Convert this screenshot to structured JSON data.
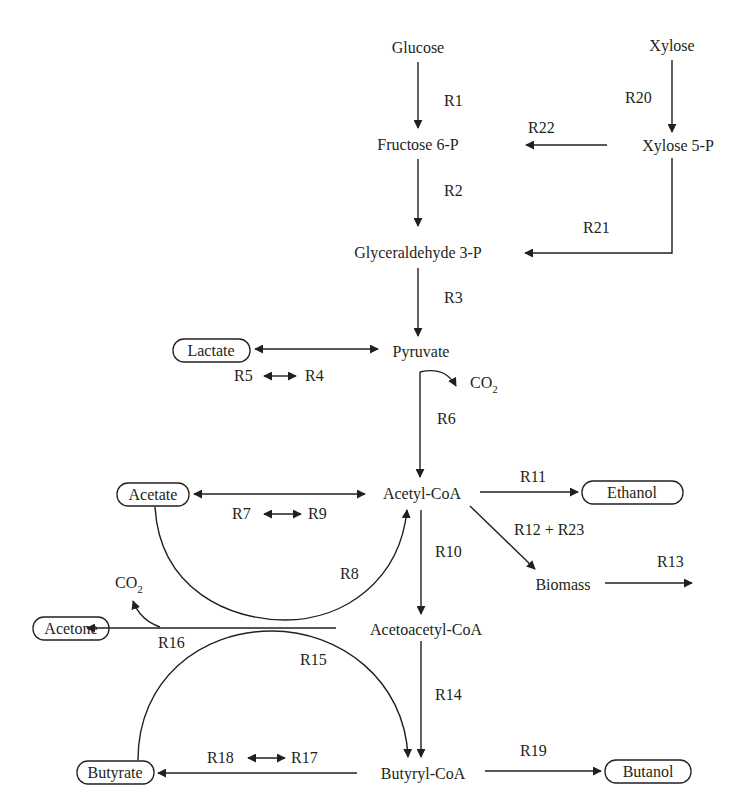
{
  "diagram": {
    "type": "metabolic-pathway",
    "metabolites": {
      "glucose": "Glucose",
      "xylose": "Xylose",
      "fructose6p": "Fructose 6-P",
      "xylose5p": "Xylose 5-P",
      "glyceraldehyde3p": "Glyceraldehyde 3-P",
      "pyruvate": "Pyruvate",
      "lactate": "Lactate",
      "co2_pyruvate": "CO",
      "co2_pyruvate_sub": "2",
      "acetylcoa": "Acetyl-CoA",
      "acetate": "Acetate",
      "ethanol": "Ethanol",
      "biomass": "Biomass",
      "acetoacetylcoa": "Acetoacetyl-CoA",
      "acetone": "Acetone",
      "co2_acetone": "CO",
      "co2_acetone_sub": "2",
      "butyrylcoa": "Butyryl-CoA",
      "butyrate": "Butyrate",
      "butanol": "Butanol"
    },
    "reactions": {
      "r1": "R1",
      "r2": "R2",
      "r3": "R3",
      "r4": "R4",
      "r5": "R5",
      "r6": "R6",
      "r7": "R7",
      "r8": "R8",
      "r9": "R9",
      "r10": "R10",
      "r11": "R11",
      "r12_r23": "R12 + R23",
      "r13": "R13",
      "r14": "R14",
      "r15": "R15",
      "r16": "R16",
      "r17": "R17",
      "r18": "R18",
      "r19": "R19",
      "r20": "R20",
      "r21": "R21",
      "r22": "R22"
    },
    "boxed_products": [
      "Lactate",
      "Acetate",
      "Ethanol",
      "Acetone",
      "Butyrate",
      "Butanol"
    ],
    "edges": [
      {
        "from": "Glucose",
        "to": "Fructose 6-P",
        "label": "R1"
      },
      {
        "from": "Fructose 6-P",
        "to": "Glyceraldehyde 3-P",
        "label": "R2"
      },
      {
        "from": "Glyceraldehyde 3-P",
        "to": "Pyruvate",
        "label": "R3"
      },
      {
        "from": "Pyruvate",
        "to": "Lactate",
        "label": "R5 / R4",
        "bidirectional": true
      },
      {
        "from": "Pyruvate",
        "to": "Acetyl-CoA",
        "label": "R6",
        "byproduct": "CO2"
      },
      {
        "from": "Acetyl-CoA",
        "to": "Acetate",
        "label": "R7 / R9",
        "bidirectional": true
      },
      {
        "from": "Acetate",
        "to": "Acetyl-CoA",
        "label": "R8"
      },
      {
        "from": "Acetyl-CoA",
        "to": "Ethanol",
        "label": "R11"
      },
      {
        "from": "Acetyl-CoA",
        "to": "Biomass",
        "label": "R12 + R23"
      },
      {
        "from": "Biomass",
        "to": "out",
        "label": "R13"
      },
      {
        "from": "Acetyl-CoA",
        "to": "Acetoacetyl-CoA",
        "label": "R10"
      },
      {
        "from": "Acetoacetyl-CoA",
        "to": "Acetone",
        "label": "R16",
        "byproduct": "CO2"
      },
      {
        "from": "Acetoacetyl-CoA",
        "to": "Butyryl-CoA",
        "label": "R14"
      },
      {
        "from": "Butyrate",
        "to": "Butyryl-CoA",
        "label": "R15"
      },
      {
        "from": "Butyryl-CoA",
        "to": "Butyrate",
        "label": "R18 / R17",
        "bidirectional": true
      },
      {
        "from": "Butyryl-CoA",
        "to": "Butanol",
        "label": "R19"
      },
      {
        "from": "Xylose",
        "to": "Xylose 5-P",
        "label": "R20"
      },
      {
        "from": "Xylose 5-P",
        "to": "Glyceraldehyde 3-P",
        "label": "R21"
      },
      {
        "from": "Xylose 5-P",
        "to": "Fructose 6-P",
        "label": "R22"
      }
    ]
  }
}
